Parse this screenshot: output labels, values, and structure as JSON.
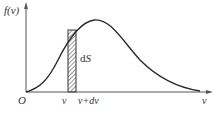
{
  "diagram": {
    "y_axis_label": "f(v)",
    "x_axis_label": "v",
    "origin_label": "O",
    "strip_left_label": "v",
    "strip_right_label": "v+dv",
    "area_label_d": "d",
    "area_label_S": "S",
    "colors": {
      "axis": "#555555",
      "curve": "#2a2a2a",
      "strip_fill": "#ffffff",
      "hatch": "#333333"
    }
  }
}
